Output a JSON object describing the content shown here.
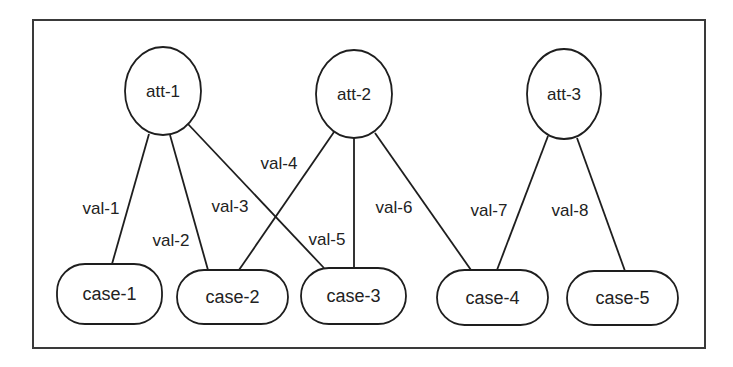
{
  "diagram": {
    "frame": {
      "x": 33,
      "y": 20,
      "width": 672,
      "height": 328
    },
    "colors": {
      "stroke": "#1e1e1e",
      "text": "#222222",
      "frame": "#3a3a3a",
      "background": "#ffffff"
    },
    "attributes": [
      {
        "id": "att-1",
        "label": "att-1",
        "cx": 163,
        "cy": 91,
        "rx": 38,
        "ry": 44
      },
      {
        "id": "att-2",
        "label": "att-2",
        "cx": 354,
        "cy": 94,
        "rx": 38,
        "ry": 44
      },
      {
        "id": "att-3",
        "label": "att-3",
        "cx": 564,
        "cy": 94,
        "rx": 37,
        "ry": 45
      }
    ],
    "cases": [
      {
        "id": "case-1",
        "label": "case-1",
        "x": 57,
        "y": 264,
        "width": 105,
        "height": 60
      },
      {
        "id": "case-2",
        "label": "case-2",
        "x": 177,
        "y": 270,
        "width": 111,
        "height": 54
      },
      {
        "id": "case-3",
        "label": "case-3",
        "x": 301,
        "y": 268,
        "width": 105,
        "height": 56
      },
      {
        "id": "case-4",
        "label": "case-4",
        "x": 437,
        "y": 270,
        "width": 111,
        "height": 55
      },
      {
        "id": "case-5",
        "label": "case-5",
        "x": 567,
        "y": 271,
        "width": 111,
        "height": 54
      }
    ],
    "edges": [
      {
        "label": "val-1",
        "from": "att-1",
        "to": "case-1",
        "x1": 149,
        "y1": 134,
        "x2": 112,
        "y2": 264,
        "lx": 101,
        "ly": 208
      },
      {
        "label": "val-2",
        "from": "att-1",
        "to": "case-2",
        "x1": 170,
        "y1": 135,
        "x2": 208,
        "y2": 270,
        "lx": 171,
        "ly": 240
      },
      {
        "label": "val-3",
        "from": "att-1",
        "to": "case-3",
        "x1": 188,
        "y1": 124,
        "x2": 324,
        "y2": 268,
        "lx": 230,
        "ly": 206
      },
      {
        "label": "val-4",
        "from": "att-2",
        "to": "case-2",
        "x1": 334,
        "y1": 132,
        "x2": 239,
        "y2": 270,
        "lx": 279,
        "ly": 163
      },
      {
        "label": "val-5",
        "from": "att-2",
        "to": "case-3",
        "x1": 354,
        "y1": 138,
        "x2": 354,
        "y2": 268,
        "lx": 327,
        "ly": 239
      },
      {
        "label": "val-6",
        "from": "att-2",
        "to": "case-4",
        "x1": 375,
        "y1": 133,
        "x2": 471,
        "y2": 270,
        "lx": 394,
        "ly": 207
      },
      {
        "label": "val-7",
        "from": "att-3",
        "to": "case-4",
        "x1": 548,
        "y1": 136,
        "x2": 497,
        "y2": 270,
        "lx": 489,
        "ly": 210
      },
      {
        "label": "val-8",
        "from": "att-3",
        "to": "case-5",
        "x1": 577,
        "y1": 138,
        "x2": 625,
        "y2": 271,
        "lx": 570,
        "ly": 210
      }
    ]
  }
}
